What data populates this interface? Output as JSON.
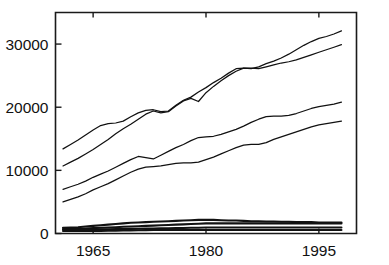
{
  "chart_data": {
    "type": "line",
    "title": "",
    "xlabel": "",
    "ylabel": "",
    "xlim": [
      1960,
      2000
    ],
    "ylim": [
      0,
      35000
    ],
    "grid": false,
    "legend": "none",
    "x_ticks": [
      "1965",
      "1980",
      "1995"
    ],
    "x_tick_values": [
      1965,
      1980,
      1995
    ],
    "y_ticks": [
      "0",
      "10000",
      "20000",
      "30000"
    ],
    "y_tick_values": [
      0,
      10000,
      20000,
      30000
    ],
    "x": [
      1961,
      1962,
      1963,
      1964,
      1965,
      1966,
      1967,
      1968,
      1969,
      1970,
      1971,
      1972,
      1973,
      1974,
      1975,
      1976,
      1977,
      1978,
      1979,
      1980,
      1981,
      1982,
      1983,
      1984,
      1985,
      1986,
      1987,
      1988,
      1989,
      1990,
      1991,
      1992,
      1993,
      1994,
      1995,
      1996,
      1997,
      1998
    ],
    "series": [
      {
        "name": "series-1",
        "values": [
          13400,
          14100,
          14800,
          15600,
          16400,
          17100,
          17400,
          17500,
          17800,
          18500,
          19100,
          19500,
          19600,
          19300,
          19400,
          20300,
          21100,
          21600,
          22400,
          23100,
          23900,
          24600,
          25400,
          26100,
          26200,
          26100,
          26400,
          26900,
          27300,
          27800,
          28400,
          29100,
          29800,
          30400,
          30900,
          31200,
          31600,
          32100
        ]
      },
      {
        "name": "series-2",
        "values": [
          10700,
          11300,
          11900,
          12600,
          13300,
          14100,
          14900,
          15800,
          16600,
          17300,
          18100,
          18900,
          19400,
          19100,
          19300,
          20200,
          21000,
          21400,
          20900,
          22300,
          23300,
          24200,
          25000,
          25700,
          26200,
          26200,
          26100,
          26400,
          26700,
          27000,
          27200,
          27500,
          27900,
          28300,
          28700,
          29100,
          29500,
          29900
        ]
      },
      {
        "name": "series-3",
        "values": [
          7000,
          7400,
          7800,
          8300,
          8900,
          9400,
          9900,
          10500,
          11100,
          11700,
          12200,
          12000,
          11800,
          12400,
          13000,
          13600,
          14100,
          14700,
          15200,
          15300,
          15400,
          15700,
          16100,
          16500,
          17000,
          17600,
          18100,
          18500,
          18600,
          18600,
          18700,
          19000,
          19400,
          19800,
          20100,
          20300,
          20500,
          20800
        ]
      },
      {
        "name": "series-4",
        "values": [
          5000,
          5400,
          5800,
          6300,
          6900,
          7400,
          7900,
          8500,
          9100,
          9700,
          10200,
          10500,
          10600,
          10700,
          10900,
          11100,
          11200,
          11200,
          11300,
          11700,
          12100,
          12600,
          13100,
          13600,
          14000,
          14100,
          14100,
          14400,
          14900,
          15300,
          15700,
          16100,
          16500,
          16900,
          17200,
          17400,
          17600,
          17800
        ]
      },
      {
        "name": "series-5",
        "values": [
          900,
          950,
          1000,
          1100,
          1200,
          1300,
          1400,
          1500,
          1600,
          1700,
          1750,
          1800,
          1850,
          1900,
          1950,
          2000,
          2050,
          2100,
          2150,
          2150,
          2150,
          2100,
          2050,
          2050,
          2000,
          1950,
          1950,
          1900,
          1900,
          1850,
          1850,
          1800,
          1800,
          1800,
          1750,
          1750,
          1750,
          1750
        ]
      },
      {
        "name": "series-6",
        "values": [
          700,
          720,
          760,
          800,
          850,
          900,
          960,
          1000,
          1060,
          1100,
          1150,
          1200,
          1250,
          1300,
          1350,
          1400,
          1450,
          1500,
          1550,
          1600,
          1600,
          1600,
          1600,
          1600,
          1600,
          1600,
          1600,
          1600,
          1600,
          1600,
          1600,
          1600,
          1600,
          1600,
          1600,
          1600,
          1600,
          1600
        ]
      },
      {
        "name": "series-7",
        "values": [
          600,
          600,
          600,
          620,
          640,
          660,
          680,
          700,
          720,
          740,
          760,
          780,
          800,
          820,
          840,
          860,
          880,
          900,
          920,
          940,
          950,
          960,
          960,
          960,
          960,
          960,
          960,
          960,
          960,
          960,
          960,
          960,
          960,
          960,
          960,
          960,
          960,
          960
        ]
      },
      {
        "name": "series-8",
        "values": [
          400,
          400,
          400,
          400,
          400,
          420,
          440,
          460,
          480,
          500,
          520,
          540,
          560,
          560,
          560,
          560,
          560,
          560,
          560,
          560,
          560,
          560,
          560,
          560,
          560,
          560,
          560,
          560,
          560,
          560,
          560,
          560,
          560,
          560,
          560,
          560,
          560,
          560
        ]
      }
    ]
  },
  "colors": {
    "axis": "#1a1a1a",
    "line": "#111111",
    "background": "#ffffff"
  }
}
